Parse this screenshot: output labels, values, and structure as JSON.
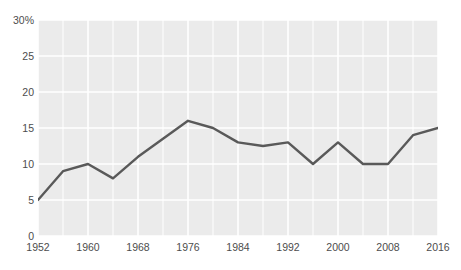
{
  "chart_data": {
    "type": "line",
    "title": "",
    "subtitle": "",
    "xlabel": "",
    "ylabel": "",
    "x": [
      1952,
      1956,
      1960,
      1964,
      1968,
      1972,
      1976,
      1980,
      1984,
      1988,
      1992,
      1996,
      2000,
      2004,
      2008,
      2012,
      2016
    ],
    "values": [
      5,
      9,
      10,
      8,
      11,
      13.5,
      16,
      15,
      13,
      12.5,
      13,
      10,
      13,
      10,
      10,
      14,
      15
    ],
    "series": [
      {
        "name": "",
        "values": [
          5,
          9,
          10,
          8,
          11,
          13.5,
          16,
          15,
          13,
          12.5,
          13,
          10,
          13,
          10,
          10,
          14,
          15
        ]
      }
    ],
    "xlim": [
      1952,
      2016
    ],
    "ylim": [
      0,
      30
    ],
    "y_ticks": [
      0,
      5,
      10,
      15,
      20,
      25,
      30
    ],
    "y_tick_labels": [
      "0",
      "5",
      "10",
      "15",
      "20",
      "25",
      "30%"
    ],
    "x_ticks": [
      1952,
      1960,
      1968,
      1976,
      1984,
      1992,
      2000,
      2008,
      2016
    ],
    "x_tick_labels": [
      "1952",
      "1960",
      "1968",
      "1976",
      "1984",
      "1992",
      "2000",
      "2008",
      "2016"
    ],
    "x_gridlines": [
      1952,
      1956,
      1960,
      1964,
      1968,
      1972,
      1976,
      1980,
      1984,
      1988,
      1992,
      1996,
      2000,
      2004,
      2008,
      2012,
      2016
    ],
    "grid": true,
    "legend": "none",
    "colors": {
      "line": "#595959",
      "plot_background": "#ebebeb",
      "gridline": "#ffffff",
      "page_background": "#ffffff",
      "tick_text": "#4d4d4d"
    },
    "line_width": 2.4
  }
}
